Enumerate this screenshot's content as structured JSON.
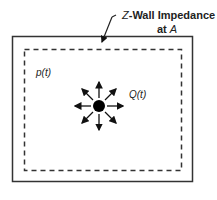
{
  "diagram": {
    "wall_label_prefix": "Z",
    "wall_label_line1": "-Wall Impedance",
    "wall_label_line2_prefix": "at ",
    "wall_label_line2_var": "A",
    "pressure_label": "p(t)",
    "source_label": "Q(t)",
    "colors": {
      "line": "#333333",
      "dot": "#000000",
      "background": "#ffffff"
    }
  }
}
